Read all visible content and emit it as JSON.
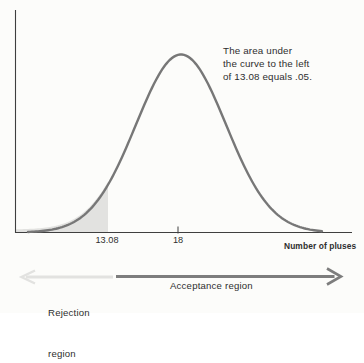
{
  "chart_data": {
    "type": "area",
    "curve": "normal-distribution",
    "title": "",
    "xlabel": "Number of pluses",
    "ylabel": "",
    "mean": 18,
    "critical_value": 13.08,
    "tail_area": 0.05,
    "shaded_region": "left tail under curve to the left of 13.08",
    "ticks": [
      {
        "label": "13.08",
        "value": 13.08
      },
      {
        "label": "18",
        "value": 18
      }
    ],
    "annotation_text": "The area under the curve to the left of 13.08 equals .05.",
    "annotation_lines": [
      "The area under",
      "the curve to the left",
      "of 13.08 equals .05."
    ],
    "regions": {
      "rejection": {
        "line1": "Rejection",
        "line2": "region",
        "direction": "left"
      },
      "acceptance": {
        "label": "Acceptance region",
        "direction": "right"
      }
    },
    "colors": {
      "background": "#fcfcfa",
      "axis": "#3f3f3f",
      "curve": "#777777",
      "shaded": "#e2e2e0",
      "rejection_arrow": "#e2e2e0",
      "acceptance_arrow": "#7d7d7d",
      "text": "#2e2e2e"
    },
    "layout_hints": {
      "grid": false,
      "legend": "none",
      "x_axis_arrowed_regions": true
    }
  }
}
